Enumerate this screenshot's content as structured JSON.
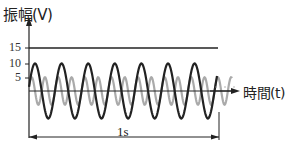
{
  "axes": {
    "y_label": "振幅(V)",
    "x_label": "時間(t)",
    "y_ticks": [
      "15",
      "10",
      "5"
    ]
  },
  "annotation": {
    "duration_label": "1s"
  },
  "colors": {
    "wave_large": "#222222",
    "wave_small": "#aaaaaa",
    "axis": "#222222"
  },
  "chart_data": {
    "type": "line",
    "title": "",
    "xlabel": "時間(t)",
    "ylabel": "振幅(V)",
    "yticks": [
      5,
      10,
      15
    ],
    "reference_lines": [
      {
        "y": 15,
        "label": "15"
      }
    ],
    "series": [
      {
        "name": "black wave",
        "amplitude": 10,
        "cycles_in_1s": 7,
        "color": "#222222"
      },
      {
        "name": "gray wave",
        "amplitude": 5,
        "cycles_in_1s": 14,
        "color": "#aaaaaa"
      }
    ],
    "duration_annotation": "1s"
  }
}
